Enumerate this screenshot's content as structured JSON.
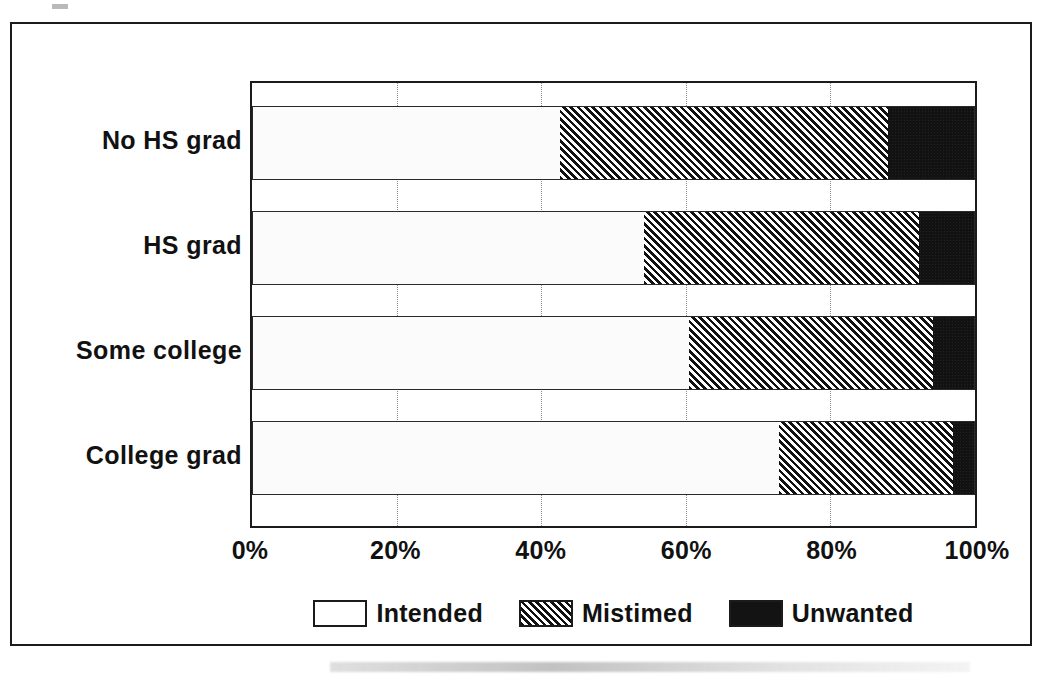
{
  "chart_data": {
    "type": "bar",
    "orientation": "horizontal",
    "stacked": true,
    "normalized": "100%",
    "title": "",
    "xlabel": "",
    "ylabel": "",
    "xlim": [
      0,
      100
    ],
    "grid": true,
    "legend_position": "bottom-center",
    "categories": [
      "No HS grad",
      "HS grad",
      "Some college",
      "College grad"
    ],
    "tick_labels": [
      "0%",
      "20%",
      "40%",
      "60%",
      "80%",
      "100%"
    ],
    "tick_values": [
      0,
      20,
      40,
      60,
      80,
      100
    ],
    "series": [
      {
        "name": "Intended",
        "fill": "light-stipple",
        "values": [
          42.6,
          54.2,
          60.4,
          72.9
        ]
      },
      {
        "name": "Mistimed",
        "fill": "diagonal-hatch",
        "values": [
          45.4,
          38.0,
          33.8,
          24.1
        ]
      },
      {
        "name": "Unwanted",
        "fill": "solid-black",
        "values": [
          12.0,
          7.8,
          5.8,
          3.0
        ]
      }
    ],
    "cumulative_boundaries": [
      [
        42.6,
        88.0
      ],
      [
        54.2,
        92.2
      ],
      [
        60.4,
        94.2
      ],
      [
        72.9,
        97.0
      ]
    ]
  },
  "legend": {
    "items": [
      {
        "label": "Intended",
        "swatch": "light-stipple-swatch"
      },
      {
        "label": "Mistimed",
        "swatch": "diagonal-hatch-swatch"
      },
      {
        "label": "Unwanted",
        "swatch": "solid-black-swatch"
      }
    ]
  },
  "colors": {
    "ink": "#1b1b1b",
    "intended": "#fbfbfb",
    "mistimed": "#111111",
    "unwanted": "#121212",
    "gridline": "#8c8c8c",
    "background": "#ffffff"
  }
}
